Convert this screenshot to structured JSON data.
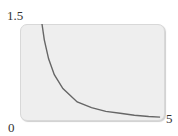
{
  "chart_data": {
    "type": "line",
    "title": "",
    "xlabel": "",
    "ylabel": "",
    "xlim": [
      0,
      5
    ],
    "ylim": [
      0,
      1.5
    ],
    "grid": false,
    "legend": null,
    "tick_labels": {
      "y_max": "1.5",
      "origin": "0",
      "x_max": "5"
    },
    "series": [
      {
        "name": "decay curve",
        "color": "#666666",
        "x": [
          0.77,
          0.85,
          1.0,
          1.2,
          1.5,
          2.0,
          2.5,
          3.0,
          3.5,
          4.0,
          4.5,
          4.9
        ],
        "y": [
          1.5,
          1.25,
          0.95,
          0.7,
          0.48,
          0.27,
          0.18,
          0.12,
          0.09,
          0.06,
          0.04,
          0.03
        ]
      }
    ],
    "colors": {
      "plot_background": "#eeeeee",
      "border": "#d8d8d8",
      "curve": "#666666"
    }
  }
}
